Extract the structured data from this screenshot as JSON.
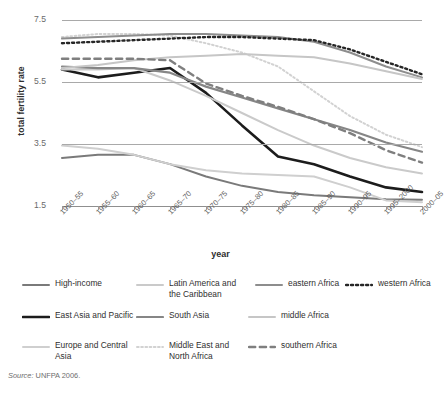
{
  "chart_data": {
    "type": "line",
    "title": "",
    "xlabel": "year",
    "ylabel": "total fertility rate",
    "categories": [
      "1950–55",
      "1955–60",
      "1960–65",
      "1965–70",
      "1970–75",
      "1975–80",
      "1980–85",
      "1985–90",
      "1990–95",
      "1995–2000",
      "2000–05"
    ],
    "ylim": [
      1.5,
      7.5
    ],
    "yticks": [
      7.5,
      5.5,
      3.5,
      1.5
    ],
    "grid": true,
    "legend_position": "bottom",
    "series": [
      {
        "name": "High-income",
        "color": "#7a7a7a",
        "width": 2.0,
        "dash": "solid",
        "values": [
          3.05,
          3.15,
          3.15,
          2.85,
          2.45,
          2.15,
          1.95,
          1.85,
          1.78,
          1.72,
          1.7
        ]
      },
      {
        "name": "East Asia and Pacific",
        "color": "#1c1c1c",
        "width": 2.6,
        "dash": "solid",
        "values": [
          5.9,
          5.65,
          5.8,
          5.95,
          5.15,
          4.1,
          3.1,
          2.85,
          2.45,
          2.1,
          1.95
        ]
      },
      {
        "name": "Europe and Central Asia",
        "color": "#cfcfcf",
        "width": 2.0,
        "dash": "solid",
        "values": [
          3.45,
          3.35,
          3.15,
          2.85,
          2.65,
          2.55,
          2.5,
          2.45,
          2.1,
          1.68,
          1.62
        ]
      },
      {
        "name": "Latin America and the Caribbean",
        "color": "#cacaca",
        "width": 2.0,
        "dash": "solid",
        "values": [
          5.9,
          5.9,
          5.95,
          5.55,
          5.05,
          4.5,
          3.95,
          3.45,
          3.05,
          2.75,
          2.55
        ]
      },
      {
        "name": "South Asia",
        "color": "#868686",
        "width": 2.2,
        "dash": "solid",
        "values": [
          6.0,
          5.95,
          5.95,
          5.8,
          5.35,
          5.0,
          4.65,
          4.3,
          3.95,
          3.55,
          3.25
        ]
      },
      {
        "name": "Middle East and North Africa",
        "color": "#d2d2d2",
        "width": 2.0,
        "dash": "dotted",
        "values": [
          6.95,
          7.05,
          7.05,
          7.0,
          6.75,
          6.45,
          6.0,
          5.2,
          4.4,
          3.8,
          3.4
        ]
      },
      {
        "name": "eastern Africa",
        "color": "#8d8d8d",
        "width": 2.0,
        "dash": "solid",
        "values": [
          6.9,
          6.95,
          7.0,
          7.05,
          7.05,
          7.0,
          6.95,
          6.8,
          6.45,
          6.0,
          5.65
        ]
      },
      {
        "name": "middle Africa",
        "color": "#c6c6c6",
        "width": 2.0,
        "dash": "solid",
        "values": [
          5.95,
          6.05,
          6.2,
          6.3,
          6.35,
          6.4,
          6.35,
          6.3,
          6.1,
          5.85,
          5.6
        ]
      },
      {
        "name": "western Africa",
        "color": "#262626",
        "width": 2.4,
        "dash": "dotted",
        "values": [
          6.75,
          6.8,
          6.85,
          6.9,
          6.95,
          6.95,
          6.9,
          6.85,
          6.55,
          6.15,
          5.75
        ]
      },
      {
        "name": "southern Africa",
        "color": "#7f7f7f",
        "width": 2.4,
        "dash": "dashed",
        "values": [
          6.25,
          6.25,
          6.25,
          6.2,
          5.45,
          5.05,
          4.7,
          4.3,
          3.85,
          3.3,
          2.9
        ]
      }
    ]
  },
  "legend": {
    "items": [
      {
        "label": "High-income",
        "key": "High-income"
      },
      {
        "label": "Latin America and\nthe Caribbean",
        "key": "Latin America and the Caribbean"
      },
      {
        "label": "eastern Africa",
        "key": "eastern Africa"
      },
      {
        "label": "western Africa",
        "key": "western Africa"
      },
      {
        "label": "East Asia and Pacific",
        "key": "East Asia and Pacific"
      },
      {
        "label": "South Asia",
        "key": "South Asia"
      },
      {
        "label": "middle Africa",
        "key": "middle Africa"
      },
      {
        "label": "Europe and Central\nAsia",
        "key": "Europe and Central Asia"
      },
      {
        "label": "Middle East and\nNorth Africa",
        "key": "Middle East and North Africa"
      },
      {
        "label": "southern Africa",
        "key": "southern Africa"
      }
    ]
  },
  "source": {
    "prefix": "Source:",
    "text": "UNFPA 2006."
  }
}
